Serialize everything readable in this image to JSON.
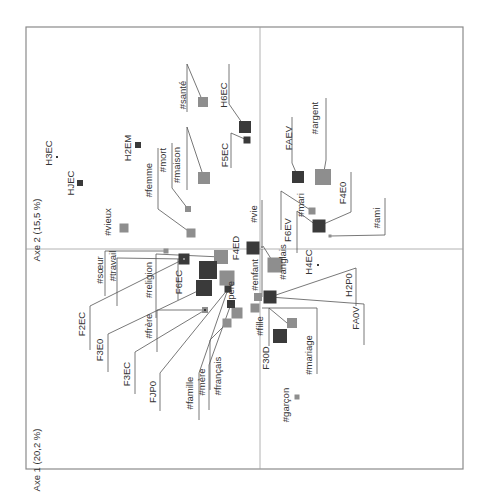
{
  "chart_data": {
    "type": "scatter",
    "title": "",
    "xlabel": "Axe 1 (20,2 %)",
    "ylabel": "Axe 2 (15,5 %)",
    "grid": false,
    "legend": null,
    "frame": {
      "x0": 26,
      "y0": 27,
      "x1": 463,
      "y1": 469
    },
    "axes_origin": {
      "x": 260,
      "y": 249
    },
    "colors": {
      "dark": "#3a3a3a",
      "light": "#8e8e8e",
      "frame": "#8a8a8a",
      "line": "#555555"
    },
    "axis_labels": [
      {
        "text": "Axe 2 (15,5 %)",
        "x": 40,
        "y": 230,
        "rot": -90
      },
      {
        "text": "Axe 1 (20,2 %)",
        "x": 40,
        "y": 460,
        "rot": -90
      }
    ],
    "points": [
      {
        "id": "#santé",
        "cls": "light",
        "x": 203,
        "y": 102,
        "s": 10,
        "lx": 186,
        "ly": 95,
        "leader": [
          [
            187,
            64
          ],
          [
            203,
            102
          ]
        ],
        "bar": [
          [
            187,
            64
          ],
          [
            187,
            112
          ]
        ]
      },
      {
        "id": "H6EC",
        "cls": "dark",
        "x": 245,
        "y": 127,
        "s": 12,
        "lx": 227,
        "ly": 95,
        "leader": [
          [
            229,
            104
          ],
          [
            245,
            127
          ]
        ],
        "bar": [
          [
            229,
            64
          ],
          [
            229,
            104
          ]
        ]
      },
      {
        "id": "F5EC",
        "cls": "dark",
        "x": 247,
        "y": 140,
        "s": 7,
        "lx": 228,
        "ly": 155,
        "leader": [
          [
            231,
            133
          ],
          [
            247,
            140
          ]
        ],
        "bar": [
          [
            231,
            133
          ],
          [
            231,
            168
          ]
        ]
      },
      {
        "id": "H2EM",
        "cls": "dark",
        "x": 138,
        "y": 145,
        "s": 6,
        "lx": 131,
        "ly": 148,
        "leader": null,
        "bar": null
      },
      {
        "id": "H3EC",
        "cls": "dark",
        "x": 57,
        "y": 157,
        "s": 2,
        "lx": 52,
        "ly": 153,
        "leader": null,
        "bar": null
      },
      {
        "id": "HJEC",
        "cls": "dark",
        "x": 80,
        "y": 183,
        "s": 6,
        "lx": 74,
        "ly": 183,
        "leader": null,
        "bar": null
      },
      {
        "id": "#maison",
        "cls": "light",
        "x": 204,
        "y": 178,
        "s": 12,
        "lx": 180,
        "ly": 165,
        "leader": [
          [
            187,
            127
          ],
          [
            204,
            178
          ]
        ],
        "bar": [
          [
            187,
            127
          ],
          [
            187,
            190
          ]
        ]
      },
      {
        "id": "#mort",
        "cls": "light",
        "x": 188,
        "y": 209,
        "s": 6,
        "lx": 166,
        "ly": 160,
        "leader": [
          [
            172,
            188
          ],
          [
            188,
            209
          ]
        ],
        "bar": [
          [
            172,
            143
          ],
          [
            172,
            188
          ]
        ]
      },
      {
        "id": "#femme",
        "cls": "light",
        "x": 191,
        "y": 233,
        "s": 9,
        "lx": 152,
        "ly": 180,
        "leader": [
          [
            158,
            209
          ],
          [
            191,
            233
          ]
        ],
        "bar": [
          [
            158,
            148
          ],
          [
            158,
            209
          ]
        ]
      },
      {
        "id": "#vieux",
        "cls": "light",
        "x": 124,
        "y": 228,
        "s": 9,
        "lx": 111,
        "ly": 222,
        "leader": null,
        "bar": null
      },
      {
        "id": "FAEV",
        "cls": "dark",
        "x": 298,
        "y": 177,
        "s": 12,
        "lx": 292,
        "ly": 138,
        "leader": [
          [
            292,
            163
          ],
          [
            298,
            177
          ]
        ],
        "bar": [
          [
            292,
            117
          ],
          [
            292,
            163
          ]
        ]
      },
      {
        "id": "#argent",
        "cls": "light",
        "x": 323,
        "y": 177,
        "s": 16,
        "lx": 318,
        "ly": 118,
        "leader": [
          [
            326,
            160
          ],
          [
            323,
            177
          ]
        ],
        "bar": [
          [
            326,
            98
          ],
          [
            326,
            160
          ]
        ]
      },
      {
        "id": "#mari",
        "cls": "light",
        "x": 312,
        "y": 211,
        "s": 7,
        "lx": 304,
        "ly": 205,
        "leader": [
          [
            281,
            191
          ],
          [
            312,
            211
          ]
        ],
        "bar": [
          [
            281,
            191
          ],
          [
            281,
            230
          ]
        ]
      },
      {
        "id": "F4E0",
        "cls": "dark",
        "x": 319,
        "y": 226,
        "s": 13,
        "lx": 346,
        "ly": 193,
        "leader": [
          [
            351,
            212
          ],
          [
            319,
            226
          ]
        ],
        "bar": [
          [
            351,
            172
          ],
          [
            351,
            212
          ]
        ]
      },
      {
        "id": "#ami",
        "cls": "light",
        "x": 330,
        "y": 236,
        "s": 3,
        "lx": 380,
        "ly": 218,
        "leader": [
          [
            385,
            235
          ],
          [
            330,
            236
          ]
        ],
        "bar": [
          [
            385,
            198
          ],
          [
            385,
            235
          ]
        ]
      },
      {
        "id": "F6EV",
        "cls": "dark",
        "x": 320,
        "y": 228,
        "s": 4,
        "lx": 291,
        "ly": 230,
        "leader": [
          [
            297,
            211
          ],
          [
            320,
            228
          ]
        ],
        "bar": [
          [
            297,
            211
          ],
          [
            297,
            253
          ]
        ]
      },
      {
        "id": "#vie",
        "cls": "light",
        "x": 262,
        "y": 247,
        "s": 2,
        "lx": 257,
        "ly": 214,
        "leader": null,
        "bar": [
          [
            262,
            200
          ],
          [
            262,
            247
          ]
        ]
      },
      {
        "id": "F4ED",
        "cls": "dark",
        "x": 253,
        "y": 248,
        "s": 13,
        "lx": 239,
        "ly": 248,
        "leader": null,
        "bar": null
      },
      {
        "id": "#anglais",
        "cls": "light",
        "x": 275,
        "y": 265,
        "s": 15,
        "lx": 286,
        "ly": 262,
        "leader": [
          [
            263,
            246
          ],
          [
            275,
            265
          ]
        ],
        "bar": null
      },
      {
        "id": "H4EC",
        "cls": "dark",
        "x": 318,
        "y": 265,
        "s": 2,
        "lx": 312,
        "ly": 262,
        "leader": null,
        "bar": null
      },
      {
        "id": "#enfant",
        "cls": "light",
        "x": 258,
        "y": 297,
        "s": 8,
        "lx": 258,
        "ly": 275,
        "leader": null,
        "bar": [
          [
            262,
            249
          ],
          [
            262,
            297
          ]
        ]
      },
      {
        "id": "H2P0",
        "cls": "dark",
        "x": 270,
        "y": 297,
        "s": 13,
        "lx": 352,
        "ly": 285,
        "leader": [
          [
            270,
            297
          ],
          [
            356,
            268
          ]
        ],
        "bar": [
          [
            356,
            268
          ],
          [
            356,
            306
          ]
        ]
      },
      {
        "id": "FA0V",
        "cls": "dark",
        "x": 270,
        "y": 297,
        "s": 4,
        "lx": 359,
        "ly": 318,
        "leader": [
          [
            270,
            297
          ],
          [
            364,
            304
          ]
        ],
        "bar": [
          [
            364,
            304
          ],
          [
            364,
            345
          ]
        ]
      },
      {
        "id": "#fille",
        "cls": "light",
        "x": 255,
        "y": 308,
        "s": 9,
        "lx": 263,
        "ly": 326,
        "leader": null,
        "bar": null
      },
      {
        "id": "#mariage",
        "cls": "light",
        "x": 292,
        "y": 323,
        "s": 10,
        "lx": 312,
        "ly": 355,
        "leader": [
          [
            262,
            308
          ],
          [
            317,
            308
          ]
        ],
        "bar": [
          [
            317,
            308
          ],
          [
            317,
            374
          ]
        ]
      },
      {
        "id": "F30D",
        "cls": "dark",
        "x": 280,
        "y": 336,
        "s": 14,
        "lx": 269,
        "ly": 358,
        "leader": [
          [
            269,
            308
          ],
          [
            287,
            323
          ]
        ],
        "bar": [
          [
            269,
            308
          ],
          [
            269,
            346
          ]
        ]
      },
      {
        "id": "#garçon",
        "cls": "light",
        "x": 297,
        "y": 397,
        "s": 5,
        "lx": 289,
        "ly": 405,
        "leader": null,
        "bar": null
      },
      {
        "id": "#sœur",
        "cls": "light",
        "x": 166,
        "y": 251,
        "s": 5,
        "lx": 103,
        "ly": 270,
        "leader": [
          [
            105,
            251
          ],
          [
            166,
            251
          ]
        ],
        "bar": [
          [
            105,
            251
          ],
          [
            105,
            296
          ]
        ]
      },
      {
        "id": "F6EC",
        "cls": "dark",
        "x": 184,
        "y": 259,
        "s": 11,
        "lx": 182,
        "ly": 282,
        "leader": null,
        "bar": [
          [
            178,
            259
          ],
          [
            178,
            300
          ]
        ]
      },
      {
        "id": "#travail",
        "cls": "light",
        "x": 184,
        "y": 259,
        "s": 2,
        "lx": 116,
        "ly": 266,
        "leader": [
          [
            117,
            258
          ],
          [
            184,
            259
          ]
        ],
        "bar": [
          [
            117,
            258
          ],
          [
            117,
            306
          ]
        ]
      },
      {
        "id": "#religion",
        "cls": "light",
        "x": 221,
        "y": 257,
        "s": 14,
        "lx": 152,
        "ly": 280,
        "leader": [
          [
            156,
            254
          ],
          [
            221,
            257
          ]
        ],
        "bar": [
          [
            156,
            254
          ],
          [
            156,
            318
          ]
        ]
      },
      {
        "id": "F2EC",
        "cls": "dark",
        "x": 208,
        "y": 270,
        "s": 18,
        "lx": 85,
        "ly": 324,
        "leader": [
          [
            90,
            306
          ],
          [
            184,
            259
          ]
        ],
        "bar": [
          [
            90,
            306
          ],
          [
            90,
            350
          ]
        ]
      },
      {
        "id": "F3E0",
        "cls": "dark",
        "x": 204,
        "y": 288,
        "s": 16,
        "lx": 103,
        "ly": 350,
        "leader": [
          [
            108,
            334
          ],
          [
            204,
            288
          ]
        ],
        "bar": [
          [
            108,
            334
          ],
          [
            108,
            372
          ]
        ]
      },
      {
        "id": "#frère",
        "cls": "light",
        "x": 205,
        "y": 310,
        "s": 6,
        "lx": 152,
        "ly": 326,
        "leader": [
          [
            157,
            310
          ],
          [
            205,
            310
          ]
        ],
        "bar": [
          [
            157,
            310
          ],
          [
            157,
            352
          ]
        ]
      },
      {
        "id": "F3EC",
        "cls": "dark",
        "x": 205,
        "y": 310,
        "s": 2,
        "lx": 130,
        "ly": 374,
        "leader": [
          [
            135,
            352
          ],
          [
            205,
            310
          ]
        ],
        "bar": [
          [
            135,
            352
          ],
          [
            135,
            394
          ]
        ]
      },
      {
        "id": "#père",
        "cls": "light",
        "x": 227,
        "y": 278,
        "s": 15,
        "lx": 234,
        "ly": 293,
        "leader": null,
        "bar": null
      },
      {
        "id": "FJP0",
        "cls": "dark",
        "x": 228,
        "y": 289,
        "s": 7,
        "lx": 156,
        "ly": 392,
        "leader": [
          [
            160,
            373
          ],
          [
            228,
            289
          ]
        ],
        "bar": [
          [
            160,
            373
          ],
          [
            160,
            411
          ]
        ]
      },
      {
        "id": "#famille",
        "cls": "light",
        "x": 237,
        "y": 313,
        "s": 11,
        "lx": 193,
        "ly": 393,
        "leader": [
          [
            199,
            373
          ],
          [
            228,
            289
          ]
        ],
        "bar": [
          [
            199,
            373
          ],
          [
            199,
            420
          ]
        ]
      },
      {
        "id": "#mère",
        "cls": "dark",
        "x": 231,
        "y": 304,
        "s": 8,
        "lx": 205,
        "ly": 382,
        "leader": [
          [
            209,
            365
          ],
          [
            231,
            304
          ]
        ],
        "bar": [
          [
            209,
            365
          ],
          [
            209,
            410
          ]
        ]
      },
      {
        "id": "#français",
        "cls": "light",
        "x": 227,
        "y": 323,
        "s": 9,
        "lx": 221,
        "ly": 376,
        "leader": [
          [
            210,
            340
          ],
          [
            227,
            323
          ]
        ],
        "bar": [
          [
            210,
            340
          ],
          [
            210,
            390
          ]
        ]
      }
    ]
  }
}
